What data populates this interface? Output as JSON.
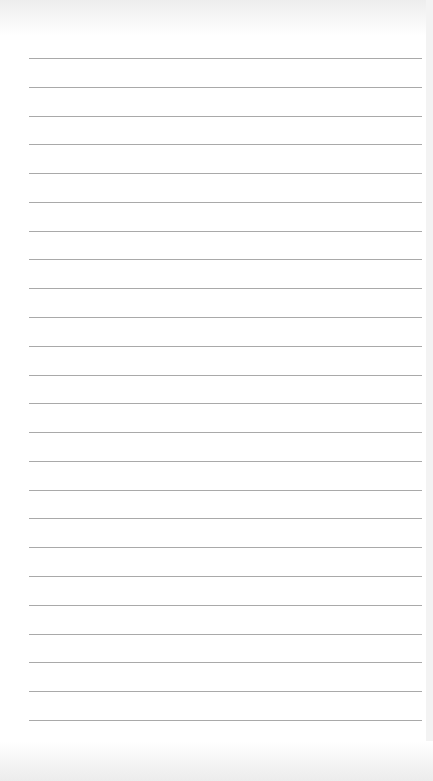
{
  "page": {
    "type": "lined-paper",
    "background_color": "#ffffff",
    "line_color": "#a9a9a9",
    "line_count": 24,
    "first_line_y": 58,
    "line_spacing": 28.78,
    "line_left": 29,
    "line_right": 422
  }
}
